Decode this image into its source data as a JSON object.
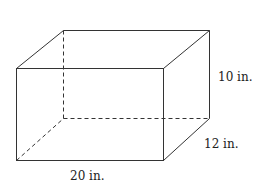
{
  "diagram": {
    "type": "rectangular-prism",
    "dimensions": {
      "height": "10 in.",
      "depth": "12 in.",
      "length": "20 in."
    },
    "colors": {
      "line": "#333333",
      "background": "#ffffff"
    }
  }
}
